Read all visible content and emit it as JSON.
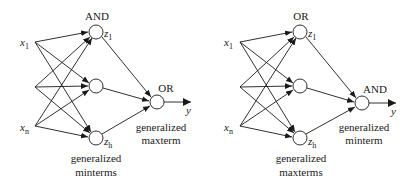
{
  "diagrams": [
    {
      "name": "left-network",
      "hidden_gate": "AND",
      "output_gate": "OR",
      "hidden_caption": [
        "generalized",
        "minterms"
      ],
      "output_caption": [
        "generalized",
        "maxterm"
      ],
      "inputs": [
        {
          "label": "x",
          "sub": "1"
        },
        {
          "label": "",
          "sub": ""
        },
        {
          "label": "x",
          "sub": "n"
        }
      ],
      "hidden": [
        {
          "label": "z",
          "sub": "1"
        },
        {
          "label": "",
          "sub": ""
        },
        {
          "label": "z",
          "sub": "h"
        }
      ],
      "output_label": "y"
    },
    {
      "name": "right-network",
      "hidden_gate": "OR",
      "output_gate": "AND",
      "hidden_caption": [
        "generalized",
        "maxterms"
      ],
      "output_caption": [
        "generalized",
        "minterm"
      ],
      "inputs": [
        {
          "label": "x",
          "sub": "1"
        },
        {
          "label": "",
          "sub": ""
        },
        {
          "label": "x",
          "sub": "n"
        }
      ],
      "hidden": [
        {
          "label": "z",
          "sub": "1"
        },
        {
          "label": "",
          "sub": ""
        },
        {
          "label": "z",
          "sub": "h"
        }
      ],
      "output_label": "y"
    }
  ]
}
